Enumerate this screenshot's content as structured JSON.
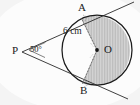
{
  "figure": {
    "background_color": "#f2f2f2",
    "paper_color": "#ffffff",
    "stroke_color": "#1a1a1a",
    "shade_fill_color": "#cfcfcf",
    "shade_line_color": "#9a9a9a",
    "labels": {
      "external_point": "P",
      "tangent_point_top": "A",
      "tangent_point_bottom": "B",
      "center": "O",
      "angle_value": "50°",
      "radius_value": "6 cm"
    },
    "measurements": {
      "angle_at_p_degrees": 50,
      "radius_cm": 6,
      "radius_unit": "cm"
    },
    "geometry": {
      "center_x": 97,
      "center_y": 50,
      "radius_px": 35,
      "point_p_x": 22,
      "point_p_y": 52,
      "point_a_x": 81.5,
      "point_a_y": 18.5,
      "point_b_x": 82.5,
      "point_b_y": 83.5
    },
    "shaded_region": "major-sector-AOB",
    "elements": [
      "circle-outline",
      "tangent-line-PA",
      "tangent-line-PB",
      "radius-OA-dashed",
      "radius-OB-dashed",
      "center-dot",
      "angle-marker-at-P",
      "right-angle-mark-A",
      "right-angle-mark-B",
      "shaded-sector"
    ]
  }
}
